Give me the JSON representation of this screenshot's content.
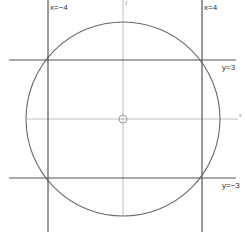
{
  "diagram": {
    "title": "",
    "type": "circle with bounding lines",
    "colors": {
      "background": "#ffffff",
      "circle": "#666666",
      "bounding_lines": "#555555",
      "axes": "#aaaaaa",
      "text": "#333333"
    },
    "axes": {
      "x_label": "x",
      "y_label": "y"
    },
    "circle": {
      "equation": "x²+y²=25",
      "center": [
        0,
        0
      ],
      "radius": 5
    },
    "lines": [
      {
        "id": "x-neg-4",
        "label": "x=−4",
        "orientation": "vertical",
        "value": -4
      },
      {
        "id": "x-pos-4",
        "label": "x=4",
        "orientation": "vertical",
        "value": 4
      },
      {
        "id": "y-pos-3",
        "label": "y=3",
        "orientation": "horizontal",
        "value": 3
      },
      {
        "id": "y-neg-3",
        "label": "y=−3",
        "orientation": "horizontal",
        "value": -3
      }
    ],
    "origin_marker": "small circle"
  }
}
